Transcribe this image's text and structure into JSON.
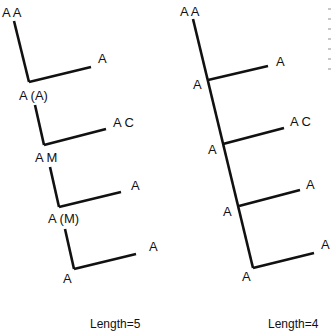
{
  "left_tree": {
    "labels": {
      "top": "A A",
      "branch1_tip": "A",
      "node1": "A (A)",
      "branch2_tip": "A C",
      "node2": "A M",
      "branch3_tip": "A",
      "node3": "A (M)",
      "branch4_tip": "A",
      "bottom": "A"
    },
    "caption": "Length=5"
  },
  "right_tree": {
    "labels": {
      "top": "A A",
      "node1": "A",
      "branch1_tip": "A",
      "node2": "A",
      "branch2_tip": "A C",
      "node3": "A",
      "branch3_tip": "A",
      "bottom": "A",
      "branch4_tip": "A"
    },
    "caption": "Length=4"
  },
  "colors": {
    "stroke": "#111111",
    "background": "#ffffff"
  }
}
